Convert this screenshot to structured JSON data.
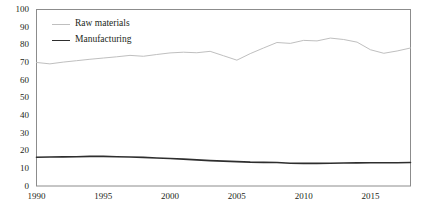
{
  "chart_data": {
    "type": "line",
    "title": "",
    "subtitle": "",
    "xlabel": "",
    "ylabel": "",
    "xlim": [
      1990,
      2018
    ],
    "ylim": [
      0,
      100
    ],
    "grid": false,
    "legend_position": "top-left inside plot",
    "x": [
      1990,
      1991,
      1992,
      1993,
      1994,
      1995,
      1996,
      1997,
      1998,
      1999,
      2000,
      2001,
      2002,
      2003,
      2004,
      2005,
      2006,
      2007,
      2008,
      2009,
      2010,
      2011,
      2012,
      2013,
      2014,
      2015,
      2016,
      2017,
      2018
    ],
    "xticks": [
      1990,
      1995,
      2000,
      2005,
      2010,
      2015
    ],
    "xtick_labels": [
      "1990",
      "1995",
      "2000",
      "2005",
      "2010",
      "2015"
    ],
    "yticks": [
      0,
      10,
      20,
      30,
      40,
      50,
      60,
      70,
      80,
      90,
      100
    ],
    "ytick_labels": [
      "0",
      "10",
      "20",
      "30",
      "40",
      "50",
      "60",
      "70",
      "80",
      "90",
      "100"
    ],
    "series": [
      {
        "name": "Raw materials",
        "color": "#bfbfbf",
        "linewidth": 1,
        "values": [
          70,
          69.2,
          70.2,
          71,
          71.8,
          72.5,
          73.2,
          74,
          73.5,
          74.5,
          75.4,
          75.8,
          75.5,
          76.3,
          73.8,
          71.3,
          75,
          78.2,
          81.3,
          80.8,
          82.5,
          82.2,
          83.8,
          83,
          81.5,
          77.2,
          75.2,
          76.5,
          78.2
        ]
      },
      {
        "name": "Manufacturing",
        "color": "#2e2e2e",
        "linewidth": 1.6,
        "values": [
          16.3,
          16.4,
          16.5,
          16.6,
          16.8,
          16.8,
          16.6,
          16.4,
          16.2,
          15.9,
          15.6,
          15.2,
          14.8,
          14.4,
          14.1,
          13.8,
          13.5,
          13.4,
          13.3,
          12.9,
          12.8,
          12.8,
          12.9,
          13,
          13.1,
          13.2,
          13.2,
          13.2,
          13.3
        ]
      }
    ],
    "legend_entries": [
      {
        "label": "Raw materials",
        "color": "#bfbfbf"
      },
      {
        "label": "Manufacturing",
        "color": "#2e2e2e"
      }
    ],
    "axis_color": "#8c8c8c",
    "text_color": "#231f20",
    "background": "#ffffff"
  }
}
